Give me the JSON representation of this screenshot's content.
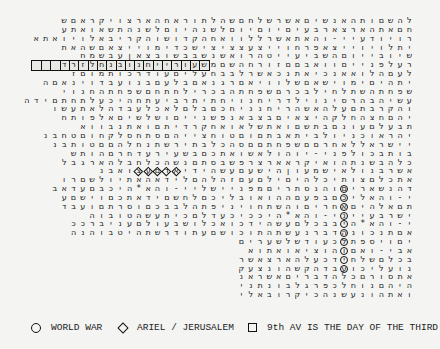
{
  "grid": {
    "rows": [
      "להשםותהאנשיםאשרשלחםשהלתוראחהארצויקראםש",
      "חםאתהארצארבעיםיוםיוםלשנהיוםלשנהתשאואתע",
      "רויודעיי-והאתאשרללוואחהקדושוהקריבאלויואתא",
      "יתלויוייצאפרחוייצעצציצישכדימוייצאםשהאת",
      "שיובייוםהשביעייטהרואשנשבבשובצאןעבשמח",
      "רעלפנייםוואבםםזורחהשםמשעורייחנובנחלזרד",
      "לעםהלואאנכיאתנכאשרלבבחעליםעודרכותמוםז",
      "יתהיםימוישאםשלוויאםרגנאםבלעםבנועבדוינאםה",
      "שפחתהשתלחילבכרםשפחתהבכרילחתחםשפחתהחנוי",
      "עשיהבהרסינוילדריחנויחתיתרביעתחהיכעלתחתםידה",
      "והקרבתםעלהאשהריחנניחכםבלםלאכלעבדהלאתעשו",
      "יהםחצהחלקהיצאיםבצבאנפשנייםושלשיםאלפותח",
      "תבעלםעונםבתשםואתשלאואחקרדיתםואתנבווא",
      "יהראוכניולביתאבתםוםטוחצייהםסתחסלקחוםטחבנ",
      "יישראללאחרםםשפחתםםסהכלבתירשתנחלהםםטותבנ",
      "בותבכולפני-יוהולאשואתכםבשעירעדחרםהותש",
      "כלהבשנתהואיקראארצרפשבסתםנשהכלחבלהארגבל",
      "אשרבנולאישמעוןהישעםעשהידיאדםעצואבנ",
      "אתכלםצותיכלהיםילםעםזהלהםלידאהאתיולשםרו",
      "דהנשאריםוהנסתריםמפניישליי-והא*היכבםעדאב",
      "י-והאליכםבפעםההואובליכםלחשםידאתכםוישםע",
      "תםאלהיםאחריםוהשתחויניפתהלבבכםוסרתםועבד",
      "ישרבעייני-והא*היככיכעדלםכיתעשהטובוה",
      "י-והא*היבבכלםעשהידכואכלושבעולםעניברככ",
      "אםתנכונהדברנעשתהתוכושםעתודרשתהיטבוהנה",
      "יםויספתלכעודשלשערים",
      "אבי-ואםוהוציאואתוא",
      "בכלםשלחידכעלהארצאשר",
      "נועליכועבדהקשהונצעק",
      "אתסורםכלהדבריםאשראנ",
      "היהםנוחלכפרגלבונתני",
      "ואתהונעשנהכיקרובאלי"
    ],
    "highlights": {
      "squares": {
        "row": 5,
        "from_col": 20,
        "to_col": 38,
        "note": "9th AV IS THE DAY OF THE THIRD"
      },
      "circles": {
        "col": 8,
        "from_row": 19,
        "to_row": 28,
        "note": "WORLD WAR"
      },
      "diamonds": {
        "row": 17,
        "from_col": 25,
        "to_col": 29,
        "note": "ARIEL / JERUSALEM"
      }
    }
  },
  "legend": {
    "items": [
      {
        "symbol": "circle",
        "label": "WORLD WAR"
      },
      {
        "symbol": "diamond",
        "label": "ARIEL / JERUSALEM"
      },
      {
        "symbol": "square",
        "label": "9th AV IS THE DAY OF THE THIRD"
      }
    ]
  }
}
